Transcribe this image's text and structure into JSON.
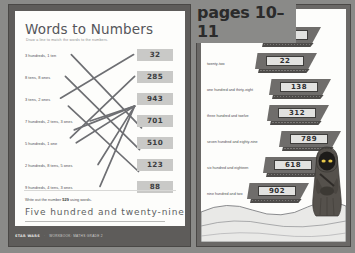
{
  "banner": {
    "pages_label": "pages 10–11"
  },
  "left_page": {
    "title": "Words to Numbers",
    "subtitle": "Draw a line to match the words to the numbers.",
    "word_labels": [
      "3 hundreds, 1 ten",
      "8 tens, 8 ones",
      "3 tens, 2 ones",
      "7 hundreds, 2 tens, 3 ones",
      "5 hundreds, 1 one",
      "2 hundreds, 8 tens, 5 ones",
      "9 hundreds, 4 tens, 3 ones"
    ],
    "numbers": [
      "32",
      "285",
      "943",
      "701",
      "510",
      "123",
      "88"
    ],
    "task": {
      "prompt_before": "Write out the number ",
      "prompt_number": "529",
      "prompt_after": " using words.",
      "answer": "Five hundred and twenty-nine"
    }
  },
  "right_page": {
    "instruction": "Write the numbers in the sandcrawlers.",
    "rows": [
      {
        "words": "forty-seven",
        "number": "47"
      },
      {
        "words": "twenty-two",
        "number": "22"
      },
      {
        "words": "one hundred and thirty-eight",
        "number": "138"
      },
      {
        "words": "three hundred and twelve",
        "number": "312"
      },
      {
        "words": "seven hundred and eighty-nine",
        "number": "789"
      },
      {
        "words": "six hundred and eighteen",
        "number": "618"
      },
      {
        "words": "nine hundred and two",
        "number": "902"
      }
    ]
  },
  "footer": {
    "brand": "STAR WARS",
    "separator": "·",
    "line": "WORKBOOK: MATHS GRADE 2"
  },
  "colors": {
    "chip_fill": "#c9c9c7",
    "ink": "#4d4e52",
    "frame": "#5e5c5a",
    "page": "#fdfdfb",
    "crawler": "#6f6d6b",
    "jawa_eye": "#e8c84a"
  }
}
